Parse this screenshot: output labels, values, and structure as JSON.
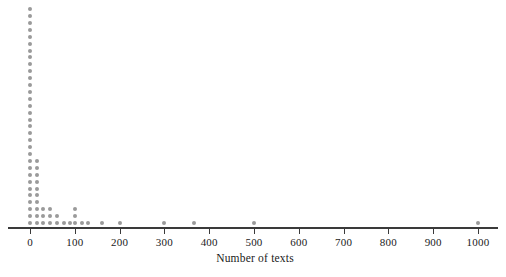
{
  "chart_data": {
    "type": "scatter",
    "chart_subtype": "dotplot",
    "title": "",
    "xlabel": "Number of texts",
    "ylabel": "",
    "xlim": [
      -15,
      1045
    ],
    "x_ticks": [
      0,
      100,
      200,
      300,
      400,
      500,
      600,
      700,
      800,
      900,
      1000
    ],
    "x_tick_labels": [
      "0",
      "100",
      "200",
      "300",
      "400",
      "500",
      "600",
      "700",
      "800",
      "900",
      "1000"
    ],
    "grid": false,
    "legend": false,
    "dot_color": "#9a9a9a",
    "axis_color": "#3a3a3a",
    "background_color": "#ffffff",
    "note": "Each dot represents one observation; dots stack vertically at each value.",
    "stacks": [
      {
        "value": 0,
        "count": 32
      },
      {
        "value": 15,
        "count": 10
      },
      {
        "value": 30,
        "count": 3
      },
      {
        "value": 45,
        "count": 3
      },
      {
        "value": 60,
        "count": 2
      },
      {
        "value": 75,
        "count": 1
      },
      {
        "value": 90,
        "count": 1
      },
      {
        "value": 100,
        "count": 3
      },
      {
        "value": 115,
        "count": 1
      },
      {
        "value": 130,
        "count": 1
      },
      {
        "value": 160,
        "count": 1
      },
      {
        "value": 200,
        "count": 1
      },
      {
        "value": 300,
        "count": 1
      },
      {
        "value": 365,
        "count": 1
      },
      {
        "value": 500,
        "count": 1
      },
      {
        "value": 1000,
        "count": 1
      }
    ]
  },
  "axis": {
    "title": "Number of texts"
  }
}
